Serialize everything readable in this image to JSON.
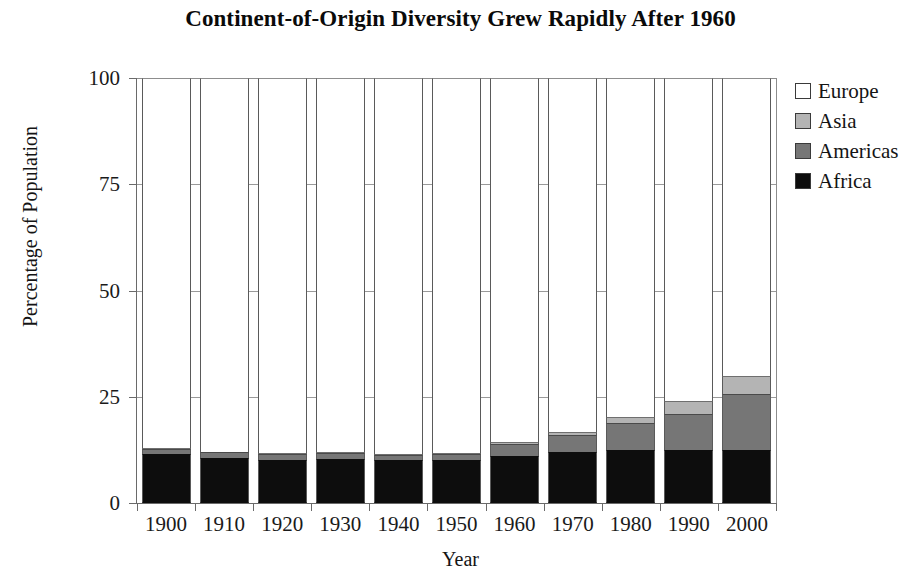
{
  "chart_data": {
    "type": "bar",
    "subtype": "stacked-bar-100-percent",
    "title": "Continent-of-Origin Diversity Grew Rapidly After 1960",
    "xlabel": "Year",
    "ylabel": "Percentage of Population",
    "ylim": [
      0,
      100
    ],
    "yticks": [
      0,
      25,
      50,
      75,
      100
    ],
    "ytick_labels": [
      "0",
      "25",
      "50",
      "75",
      "100"
    ],
    "grid": true,
    "legend_position": "right",
    "stack_order_bottom_to_top": [
      "Africa",
      "Americas",
      "Asia",
      "Europe"
    ],
    "categories": [
      "1900",
      "1910",
      "1920",
      "1930",
      "1940",
      "1950",
      "1960",
      "1970",
      "1980",
      "1990",
      "2000"
    ],
    "series": [
      {
        "name": "Africa",
        "color": "#0d0d0d",
        "values": [
          11.5,
          10.6,
          10.2,
          10.3,
          10.1,
          10.2,
          11.0,
          12.0,
          12.4,
          12.4,
          12.4
        ]
      },
      {
        "name": "Americas",
        "color": "#767676",
        "values": [
          1.2,
          1.3,
          1.4,
          1.4,
          1.3,
          1.3,
          2.8,
          4.0,
          6.4,
          8.6,
          13.2
        ]
      },
      {
        "name": "Asia",
        "color": "#b4b4b4",
        "values": [
          0.2,
          0.2,
          0.2,
          0.2,
          0.2,
          0.2,
          0.5,
          0.7,
          1.4,
          3.1,
          4.2
        ]
      },
      {
        "name": "Europe",
        "color": "#ffffff",
        "values": [
          87.1,
          87.9,
          88.2,
          88.1,
          88.4,
          88.3,
          85.7,
          83.3,
          79.8,
          75.9,
          70.2
        ]
      }
    ]
  },
  "legend": {
    "items": [
      {
        "label": "Europe",
        "color": "#ffffff"
      },
      {
        "label": "Asia",
        "color": "#b4b4b4"
      },
      {
        "label": "Americas",
        "color": "#767676"
      },
      {
        "label": "Africa",
        "color": "#0d0d0d"
      }
    ]
  }
}
